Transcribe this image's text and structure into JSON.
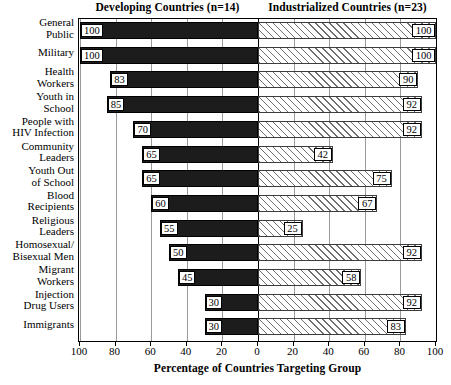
{
  "chart_data": {
    "type": "bar",
    "orientation": "horizontal",
    "layout": "diverging-paired",
    "title": "",
    "xlabel": "Percentage of Countries Targeting Group",
    "ylabel": "",
    "xlim": [
      0,
      100
    ],
    "xticks_left": [
      "100",
      "80",
      "60",
      "40",
      "20",
      "0"
    ],
    "xticks_right": [
      "0",
      "20",
      "40",
      "60",
      "80",
      "100"
    ],
    "grid": true,
    "grid_axis": "x",
    "panels": [
      {
        "key": "developing",
        "label": "Developing Countries (n=14)",
        "n": 14,
        "direction": "left",
        "fill": "solid-black"
      },
      {
        "key": "industrialized",
        "label": "Industrialized Countries (n=23)",
        "n": 23,
        "direction": "right",
        "fill": "diagonal-hatch"
      }
    ],
    "categories": [
      "General Public",
      "Military",
      "Health Workers",
      "Youth in School",
      "People with HIV Infection",
      "Community Leaders",
      "Youth Out of School",
      "Blood Recipients",
      "Religious Leaders",
      "Homosexual/Bisexual Men",
      "Migrant Workers",
      "Injection Drug Users",
      "Immigrants"
    ],
    "category_lines": [
      [
        "General",
        "Public"
      ],
      [
        "Military"
      ],
      [
        "Health",
        "Workers"
      ],
      [
        "Youth in",
        "School"
      ],
      [
        "People with",
        "HIV Infection"
      ],
      [
        "Community",
        "Leaders"
      ],
      [
        "Youth Out",
        "of School"
      ],
      [
        "Blood",
        "Recipients"
      ],
      [
        "Religious",
        "Leaders"
      ],
      [
        "Homosexual/",
        "Bisexual Men"
      ],
      [
        "Migrant",
        "Workers"
      ],
      [
        "Injection",
        "Drug Users"
      ],
      [
        "Immigrants"
      ]
    ],
    "series": [
      {
        "name": "Developing Countries (n=14)",
        "values": [
          100,
          100,
          83,
          85,
          70,
          65,
          65,
          60,
          55,
          50,
          45,
          30,
          30
        ]
      },
      {
        "name": "Industrialized Countries (n=23)",
        "values": [
          100,
          100,
          90,
          92,
          92,
          42,
          75,
          67,
          25,
          92,
          58,
          92,
          83
        ]
      }
    ]
  },
  "colors": {
    "developing_bar": "#1c1c1c",
    "industrialized_bar_hatch": "#6e6e6e",
    "industrialized_bar_bg": "#ffffff",
    "gridline": "#9a9a9a",
    "axis": "#000000",
    "text": "#000000",
    "background": "#ffffff"
  },
  "headings": {
    "developing": "Developing Countries (n=14)",
    "industrialized": "Industrialized Countries (n=23)"
  },
  "axis": {
    "title": "Percentage of Countries Targeting Group"
  }
}
